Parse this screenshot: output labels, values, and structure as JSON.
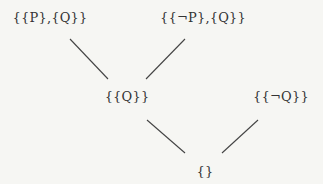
{
  "diagram": {
    "type": "hasse-lattice",
    "colors": {
      "background": "#f6f6f3",
      "text": "#333333",
      "edge": "#444444"
    },
    "nodes": [
      {
        "id": "n1",
        "label": "{{P},{Q}}",
        "x": 50,
        "y": 10
      },
      {
        "id": "n2",
        "label": "{{¬P},{Q}}",
        "x": 203,
        "y": 10
      },
      {
        "id": "n3",
        "label": "{{Q}}",
        "x": 127,
        "y": 89
      },
      {
        "id": "n4",
        "label": "{{¬Q}}",
        "x": 281,
        "y": 89
      },
      {
        "id": "n5",
        "label": "{}",
        "x": 205,
        "y": 164
      }
    ],
    "edges": [
      {
        "from": "n1",
        "to": "n3",
        "x1": 70,
        "y1": 39,
        "x2": 108,
        "y2": 79
      },
      {
        "from": "n2",
        "to": "n3",
        "x1": 185,
        "y1": 39,
        "x2": 146,
        "y2": 79
      },
      {
        "from": "n3",
        "to": "n5",
        "x1": 147,
        "y1": 120,
        "x2": 185,
        "y2": 153
      },
      {
        "from": "n4",
        "to": "n5",
        "x1": 258,
        "y1": 120,
        "x2": 222,
        "y2": 153
      }
    ]
  }
}
